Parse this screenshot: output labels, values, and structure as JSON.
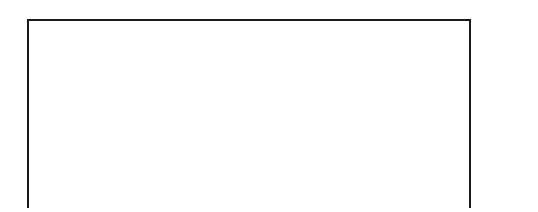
{
  "chart_data": {
    "type": "bar",
    "xlabel": "",
    "ylabel": "",
    "ylim": [
      0,
      100
    ],
    "grid": true,
    "legend": "none",
    "stacked": true,
    "categories": [
      "1",
      "2",
      "3",
      "4",
      "5",
      "6",
      "7",
      "8",
      "9",
      "10"
    ],
    "tick_labels": [
      "100%",
      "90",
      "80",
      "70",
      "60",
      "50",
      "40",
      "30",
      "20",
      "10",
      "0"
    ],
    "tick_values": [
      100,
      90,
      80,
      70,
      60,
      50,
      40,
      30,
      20,
      10,
      0
    ],
    "series": [
      {
        "name": "bottom-segment",
        "color": "#545454",
        "values": [
          33,
          24,
          19,
          14.5,
          13,
          11,
          11,
          10,
          9,
          4
        ]
      },
      {
        "name": "middle-segment",
        "color": "#bdbdbd",
        "values": [
          42,
          50,
          49,
          49.5,
          48,
          49,
          49,
          43,
          36,
          30
        ]
      },
      {
        "name": "top-segment",
        "color": "#d6d6d6",
        "values": [
          25,
          26,
          32,
          36,
          39,
          40,
          40,
          47,
          55,
          66
        ]
      }
    ],
    "cumulative_tops": [
      75,
      74,
      68,
      64,
      61,
      60,
      60,
      53,
      45,
      34
    ]
  }
}
